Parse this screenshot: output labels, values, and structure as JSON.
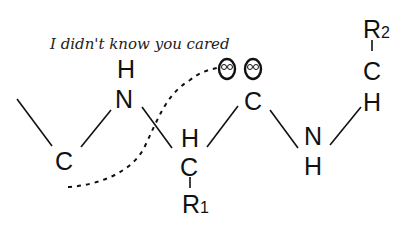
{
  "caption": "I didn't know you cared",
  "atoms": {
    "n1_h": "H",
    "n1": "N",
    "c_left": "C",
    "ca1_h": "H",
    "ca1": "C",
    "r1": "R",
    "r1_sub": "1",
    "o_left": "O",
    "o_right": "O",
    "carbonyl_c": "C",
    "n2": "N",
    "n2_h": "H",
    "ca2_h": "H",
    "ca2": "C",
    "r2": "R",
    "r2_sub": "2"
  },
  "colors": {
    "ink": "#111111",
    "background": "#ffffff"
  }
}
